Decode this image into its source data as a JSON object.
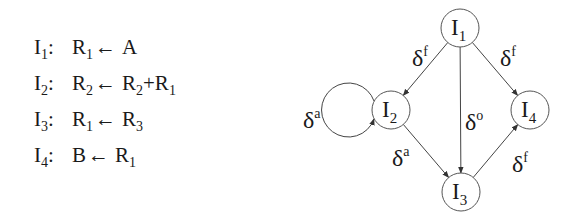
{
  "instructions": [
    {
      "id": "I",
      "sub": "1",
      "lhs": "R",
      "lhs_sub": "1",
      "arrow": "←",
      "rhs": [
        {
          "t": "A",
          "s": ""
        }
      ]
    },
    {
      "id": "I",
      "sub": "2",
      "lhs": "R",
      "lhs_sub": "2",
      "arrow": "←",
      "rhs": [
        {
          "t": "R",
          "s": "2"
        },
        {
          "t": "+R",
          "s": "1"
        }
      ]
    },
    {
      "id": "I",
      "sub": "3",
      "lhs": "R",
      "lhs_sub": "1",
      "arrow": "←",
      "rhs": [
        {
          "t": "R",
          "s": "3"
        }
      ]
    },
    {
      "id": "I",
      "sub": "4",
      "lhs": "B",
      "lhs_sub": "",
      "arrow": "←",
      "rhs": [
        {
          "t": "R",
          "s": "1"
        }
      ]
    }
  ],
  "graph": {
    "nodes": [
      {
        "id": "I1",
        "label": "I",
        "sub": "1",
        "x": 460,
        "y": 28,
        "r": 19
      },
      {
        "id": "I2",
        "label": "I",
        "sub": "2",
        "x": 391,
        "y": 110,
        "r": 19
      },
      {
        "id": "I3",
        "label": "I",
        "sub": "3",
        "x": 461,
        "y": 192,
        "r": 19
      },
      {
        "id": "I4",
        "label": "I",
        "sub": "4",
        "x": 530,
        "y": 110,
        "r": 19
      }
    ],
    "edges": [
      {
        "from": "I1",
        "to": "I2",
        "label": "δ",
        "sup": "f",
        "lx": 412,
        "ly": 66
      },
      {
        "from": "I1",
        "to": "I4",
        "label": "δ",
        "sup": "f",
        "lx": 500,
        "ly": 66
      },
      {
        "from": "I1",
        "to": "I3",
        "label": "δ",
        "sup": "o",
        "lx": 465,
        "ly": 130
      },
      {
        "from": "I2",
        "to": "I3",
        "label": "δ",
        "sup": "a",
        "lx": 392,
        "ly": 166
      },
      {
        "from": "I3",
        "to": "I4",
        "label": "δ",
        "sup": "f",
        "lx": 512,
        "ly": 172
      },
      {
        "from": "I2",
        "to": "I2",
        "label": "δ",
        "sup": "a",
        "lx": 303,
        "ly": 128,
        "loop": true
      }
    ]
  }
}
